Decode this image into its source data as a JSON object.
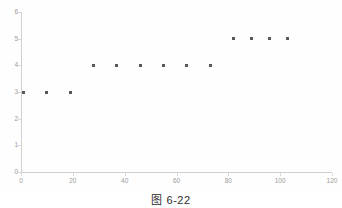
{
  "figure": {
    "caption": "图 6-22",
    "background_color": "#ffffff"
  },
  "chart_data": {
    "type": "scatter",
    "title": "",
    "subtitle": "",
    "xlabel": "",
    "ylabel": "",
    "xlim": [
      0,
      120
    ],
    "ylim": [
      0,
      6
    ],
    "grid": false,
    "legend": null,
    "legend_position": "none",
    "marker_color": "#595959",
    "axis_color": "#d0d0d0",
    "tick_label_color": "#9a9a9a",
    "x_ticks": [
      0,
      20,
      40,
      60,
      80,
      100,
      120
    ],
    "y_ticks": [
      0,
      1,
      2,
      3,
      4,
      5,
      6
    ],
    "x_tick_labels": [
      "0",
      "20",
      "40",
      "60",
      "80",
      "100",
      "120"
    ],
    "y_tick_labels": [
      "0",
      "1",
      "2",
      "3",
      "4",
      "5",
      "6"
    ],
    "points": [
      {
        "x": 1,
        "y": 3
      },
      {
        "x": 10,
        "y": 3
      },
      {
        "x": 19,
        "y": 3
      },
      {
        "x": 28,
        "y": 4
      },
      {
        "x": 37,
        "y": 4
      },
      {
        "x": 46,
        "y": 4
      },
      {
        "x": 55,
        "y": 4
      },
      {
        "x": 64,
        "y": 4
      },
      {
        "x": 73,
        "y": 4
      },
      {
        "x": 82,
        "y": 5
      },
      {
        "x": 89,
        "y": 5
      },
      {
        "x": 96,
        "y": 5
      },
      {
        "x": 103,
        "y": 5
      }
    ],
    "x": [
      1,
      10,
      19,
      28,
      37,
      46,
      55,
      64,
      73,
      82,
      89,
      96,
      103
    ],
    "values": [
      3,
      3,
      3,
      4,
      4,
      4,
      4,
      4,
      4,
      5,
      5,
      5,
      5
    ]
  }
}
